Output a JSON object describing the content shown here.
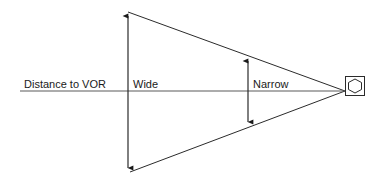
{
  "diagram": {
    "background_color": "#ffffff",
    "line_color": "#2b2b2b",
    "center_line_color": "#5a5a5a",
    "text_color": "#1a1a1a",
    "width": 379,
    "height": 185
  },
  "labels": {
    "distance_to_vor": "Distance to VOR",
    "wide": "Wide",
    "narrow": "Narrow"
  },
  "geometry": {
    "apex": {
      "x": 345,
      "y": 91
    },
    "top_vertex": {
      "x": 128,
      "y": 12
    },
    "bottom_vertex": {
      "x": 130,
      "y": 172
    },
    "center_line": {
      "x1": 20,
      "y1": 91,
      "x2": 345,
      "y2": 91
    },
    "wide_arrow": {
      "x": 128,
      "y_top": 13,
      "y_bottom": 171
    },
    "narrow_arrow": {
      "x": 248,
      "y_top": 57,
      "y_bottom": 126
    },
    "station_square": {
      "x": 345,
      "y": 76,
      "size": 20
    }
  },
  "icons": {
    "vor_station": "vor-station-icon",
    "wide_dimension": "double-headed-arrow-icon",
    "narrow_dimension": "double-headed-arrow-icon"
  },
  "label_positions": {
    "distance_to_vor": {
      "x": 24,
      "y": 88
    },
    "wide": {
      "x": 133,
      "y": 88
    },
    "narrow": {
      "x": 253,
      "y": 88
    }
  }
}
